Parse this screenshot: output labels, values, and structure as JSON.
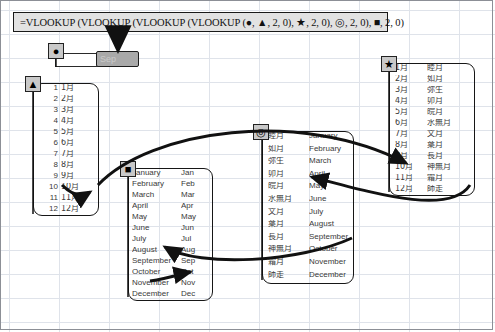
{
  "formula": {
    "text": "=VLOOKUP (VLOOKUP (VLOOKUP (VLOOKUP (●, ▲, 2, 0), ★, 2, 0), ◎, 2, 0), ■, 2, 0)"
  },
  "markers": {
    "circle": "●",
    "triangle": "▲",
    "star": "★",
    "double_circle": "◎",
    "square": "■"
  },
  "cells": {
    "source_value": "9",
    "result_value": "Sep"
  },
  "tables": {
    "triangle": {
      "marker": "▲",
      "rows": [
        {
          "key": "1",
          "value": "1月"
        },
        {
          "key": "2",
          "value": "2月"
        },
        {
          "key": "3",
          "value": "3月"
        },
        {
          "key": "4",
          "value": "4月"
        },
        {
          "key": "5",
          "value": "5月"
        },
        {
          "key": "6",
          "value": "6月"
        },
        {
          "key": "7",
          "value": "7月"
        },
        {
          "key": "8",
          "value": "8月"
        },
        {
          "key": "9",
          "value": "9月"
        },
        {
          "key": "10",
          "value": "10月"
        },
        {
          "key": "11",
          "value": "11月"
        },
        {
          "key": "12",
          "value": "12月"
        }
      ]
    },
    "star": {
      "marker": "★",
      "rows": [
        {
          "key": "1月",
          "value": "睦月"
        },
        {
          "key": "2月",
          "value": "如月"
        },
        {
          "key": "3月",
          "value": "弥生"
        },
        {
          "key": "4月",
          "value": "卯月"
        },
        {
          "key": "5月",
          "value": "皖月"
        },
        {
          "key": "6月",
          "value": "水無月"
        },
        {
          "key": "7月",
          "value": "文月"
        },
        {
          "key": "8月",
          "value": "葉月"
        },
        {
          "key": "9月",
          "value": "長月"
        },
        {
          "key": "10月",
          "value": "神無月"
        },
        {
          "key": "11月",
          "value": "霜月"
        },
        {
          "key": "12月",
          "value": "師走"
        }
      ]
    },
    "double_circle": {
      "marker": "◎",
      "rows": [
        {
          "key": "睦月",
          "value": "January"
        },
        {
          "key": "如月",
          "value": "February"
        },
        {
          "key": "弥生",
          "value": "March"
        },
        {
          "key": "卯月",
          "value": "April"
        },
        {
          "key": "皖月",
          "value": "May"
        },
        {
          "key": "水無月",
          "value": "June"
        },
        {
          "key": "文月",
          "value": "July"
        },
        {
          "key": "葉月",
          "value": "August"
        },
        {
          "key": "長月",
          "value": "September"
        },
        {
          "key": "神無月",
          "value": "October"
        },
        {
          "key": "霜月",
          "value": "November"
        },
        {
          "key": "師走",
          "value": "December"
        }
      ]
    },
    "square": {
      "marker": "■",
      "rows": [
        {
          "key": "January",
          "value": "Jan"
        },
        {
          "key": "February",
          "value": "Feb"
        },
        {
          "key": "March",
          "value": "Mar"
        },
        {
          "key": "April",
          "value": "Apr"
        },
        {
          "key": "May",
          "value": "May"
        },
        {
          "key": "June",
          "value": "Jun"
        },
        {
          "key": "July",
          "value": "Jul"
        },
        {
          "key": "August",
          "value": "Aug"
        },
        {
          "key": "September",
          "value": "Sep"
        },
        {
          "key": "October",
          "value": "Oct"
        },
        {
          "key": "November",
          "value": "Nov"
        },
        {
          "key": "December",
          "value": "Dec"
        }
      ]
    }
  },
  "colors": {
    "grid_line": "#dfe3ea",
    "ink": "#161616",
    "marker_fill": "#c9c9c9",
    "result_fill": "#a9a9a9",
    "formula_fill": "#e2e2e2"
  }
}
